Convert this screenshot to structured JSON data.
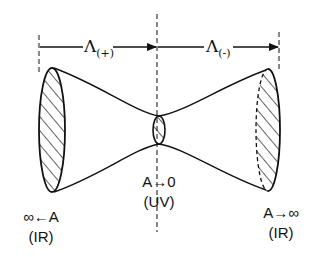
{
  "diagram": {
    "type": "throat-diagram",
    "colors": {
      "stroke": "#111111",
      "background": "#ffffff"
    },
    "scales": {
      "left": {
        "symbol": "Λ",
        "subscript": "(+)"
      },
      "right": {
        "symbol": "Λ",
        "subscript": "(-)"
      }
    },
    "labels": {
      "left_limit": "∞←A",
      "left_regime": "(IR)",
      "center_limit": "A→0",
      "center_regime": "(UV)",
      "right_limit": "A→∞",
      "right_regime": "(IR)"
    },
    "cross_sections": [
      {
        "name": "left-boundary",
        "style": "solid-hatched"
      },
      {
        "name": "throat",
        "style": "solid-hatched"
      },
      {
        "name": "right-boundary",
        "style": "dashed-hatched"
      }
    ]
  }
}
